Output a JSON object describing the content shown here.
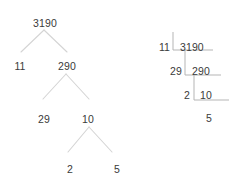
{
  "figure": {
    "title_text": "",
    "colors": {
      "background": "#ffffff",
      "text": "#3a3a3a",
      "tree_branch": "#d4d4d4",
      "ladder_rule": "#b5b5b5"
    }
  },
  "factor_tree": {
    "name": "factor-tree-of-3190",
    "root": "3190",
    "nodes": [
      {
        "id": "root",
        "label": "3190",
        "x": 45,
        "y": 18
      },
      {
        "id": "l1a",
        "label": "11",
        "x": 20,
        "y": 61
      },
      {
        "id": "l1b",
        "label": "290",
        "x": 67,
        "y": 61
      },
      {
        "id": "l2a",
        "label": "29",
        "x": 44,
        "y": 114
      },
      {
        "id": "l2b",
        "label": "10",
        "x": 88,
        "y": 114
      },
      {
        "id": "l3a",
        "label": "2",
        "x": 70,
        "y": 164
      },
      {
        "id": "l3b",
        "label": "5",
        "x": 117,
        "y": 164
      }
    ],
    "branches": [
      {
        "from": "root",
        "to": "l1a",
        "x1": 44,
        "y1": 30,
        "x2": 21,
        "y2": 52
      },
      {
        "from": "root",
        "to": "l1b",
        "x1": 44,
        "y1": 30,
        "x2": 67,
        "y2": 52
      },
      {
        "from": "l1b",
        "to": "l2a",
        "x1": 66,
        "y1": 74,
        "x2": 43,
        "y2": 99
      },
      {
        "from": "l1b",
        "to": "l2b",
        "x1": 66,
        "y1": 74,
        "x2": 89,
        "y2": 99
      },
      {
        "from": "l2b",
        "to": "l3a",
        "x1": 89,
        "y1": 127,
        "x2": 68,
        "y2": 152
      },
      {
        "from": "l2b",
        "to": "l3b",
        "x1": 89,
        "y1": 127,
        "x2": 112,
        "y2": 152
      }
    ]
  },
  "division_ladder": {
    "name": "division-ladder-of-3190",
    "rows": [
      {
        "divisor": "11",
        "dividend": "3190",
        "divisor_x": 170,
        "dividend_x": 180,
        "y": 42,
        "rule_x1": 173,
        "rule_x2": 213,
        "rule_y": 50,
        "stem_x": 173,
        "stem_y1": 32,
        "stem_y2": 50
      },
      {
        "divisor": "29",
        "dividend": "290",
        "divisor_x": 182,
        "dividend_x": 192,
        "y": 66,
        "rule_x1": 185,
        "rule_x2": 221,
        "rule_y": 75,
        "stem_x": 185,
        "stem_y1": 50,
        "stem_y2": 75
      },
      {
        "divisor": "2",
        "dividend": "10",
        "divisor_x": 190,
        "dividend_x": 200,
        "y": 90,
        "rule_x1": 194,
        "rule_x2": 229,
        "rule_y": 100,
        "stem_x": 194,
        "stem_y1": 75,
        "stem_y2": 100
      }
    ],
    "final_quotient": {
      "label": "5",
      "x": 209,
      "y": 113
    }
  }
}
